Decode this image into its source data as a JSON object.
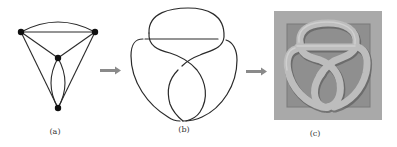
{
  "figure": {
    "panels": [
      {
        "id": "a",
        "label": "(a)",
        "description": "planar graph with 4 vertices"
      },
      {
        "id": "b",
        "label": "(b)",
        "description": "knot diagram"
      },
      {
        "id": "c",
        "label": "(c)",
        "description": "rendered 3D knot relief"
      }
    ],
    "arrows": [
      {
        "from": "a",
        "to": "b",
        "icon": "right-arrow-icon"
      },
      {
        "from": "b",
        "to": "c",
        "icon": "right-arrow-icon"
      }
    ],
    "colors": {
      "line": "#2a2a2a",
      "node": "#111111",
      "arrow": "#8a8a8a",
      "relief_outer": "#a9a9a9",
      "relief_inner": "#8f8f8f",
      "relief_tube": "#bdbdbd",
      "relief_shadow": "#6a6a6a"
    }
  }
}
